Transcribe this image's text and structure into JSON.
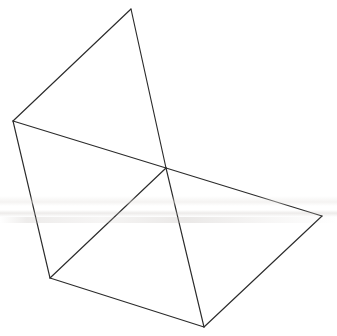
{
  "figure": {
    "canvas": {
      "width": 337,
      "height": 336
    },
    "style": {
      "background_color": "#ffffff",
      "line_color": "#2b2b2b",
      "line_width": 1.15,
      "fill": "none"
    },
    "vertices": [
      {
        "id": "apex",
        "label": "top apex",
        "x": 131,
        "y": 9
      },
      {
        "id": "left",
        "label": "left vertex",
        "x": 13,
        "y": 121
      },
      {
        "id": "center",
        "label": "center junction",
        "x": 166,
        "y": 168
      },
      {
        "id": "bottom_left",
        "label": "bottom-left vertex",
        "x": 50,
        "y": 278
      },
      {
        "id": "bottom",
        "label": "bottom vertex",
        "x": 204,
        "y": 327
      },
      {
        "id": "right",
        "label": "right vertex",
        "x": 322,
        "y": 216
      }
    ],
    "edges": [
      {
        "id": "e1",
        "name": "apex-to-left",
        "from": "apex",
        "to": "left"
      },
      {
        "id": "e2",
        "name": "apex-to-center",
        "from": "apex",
        "to": "center"
      },
      {
        "id": "e3",
        "name": "left-to-center",
        "from": "left",
        "to": "center"
      },
      {
        "id": "e4",
        "name": "left-to-bottom-left",
        "from": "left",
        "to": "bottom_left"
      },
      {
        "id": "e5",
        "name": "center-to-bottom-left",
        "from": "center",
        "to": "bottom_left"
      },
      {
        "id": "e6",
        "name": "center-to-bottom",
        "from": "center",
        "to": "bottom"
      },
      {
        "id": "e7",
        "name": "center-to-right",
        "from": "center",
        "to": "right"
      },
      {
        "id": "e8",
        "name": "bottom-left-to-bottom",
        "from": "bottom_left",
        "to": "bottom"
      },
      {
        "id": "e9",
        "name": "bottom-to-right",
        "from": "bottom",
        "to": "right"
      }
    ],
    "artifacts": {
      "scan_band_present": true,
      "scan_band_y_range": [
        196,
        223
      ],
      "scan_band_note": "faint horizontal grey smudge across the page from scanning"
    }
  }
}
